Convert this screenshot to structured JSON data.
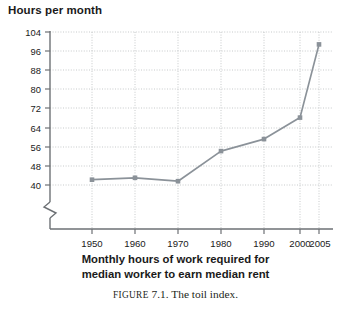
{
  "figure": {
    "caption_prefix": "FIGURE",
    "caption_text": "7.1. The toil index."
  },
  "chart_data": {
    "type": "line",
    "title": "",
    "ylabel": "Hours per month",
    "xlabel_line1": "Monthly hours of work required for",
    "xlabel_line2": "median worker to earn median rent",
    "categories": [
      "1950",
      "1960",
      "1970",
      "1980",
      "1990",
      "2000",
      "2005"
    ],
    "x": [
      1950,
      1960,
      1970,
      1980,
      1990,
      2000,
      2005
    ],
    "values": [
      42.2,
      43.0,
      41.6,
      54.2,
      59.2,
      68.2,
      98.8
    ],
    "yticks": [
      104,
      96,
      88,
      80,
      72,
      64,
      56,
      48,
      40
    ],
    "ylim": [
      40,
      104
    ],
    "ytick_step": 8,
    "xticks": [
      "1950",
      "1960",
      "1970",
      "1980",
      "1990",
      "2000",
      "2005"
    ],
    "axis_break": true,
    "grid": "dotted-both",
    "legend": "none",
    "series_color": "#8b9299",
    "marker": "square",
    "series": [
      {
        "name": "Toil index",
        "values": [
          42.2,
          43.0,
          41.6,
          54.2,
          59.2,
          68.2,
          98.8
        ]
      }
    ]
  }
}
